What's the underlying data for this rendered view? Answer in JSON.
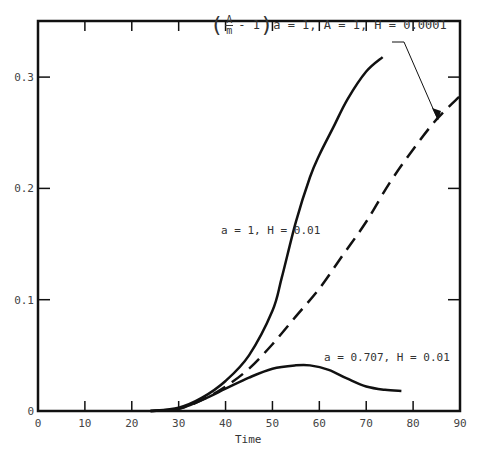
{
  "chart_data": {
    "type": "line",
    "title": "",
    "xlabel": "Time",
    "ylabel": "",
    "xlim": [
      0,
      90
    ],
    "ylim": [
      0,
      0.35
    ],
    "x_ticks": [
      "0",
      "10",
      "20",
      "30",
      "40",
      "50",
      "60",
      "70",
      "80",
      "90"
    ],
    "y_ticks": [
      "0",
      "0.1",
      "0.2",
      "0.3"
    ],
    "grid": false,
    "series": [
      {
        "name": "a = 1, H = 0.01",
        "style": "solid",
        "x": [
          24,
          30,
          35,
          40,
          45,
          50,
          52,
          55,
          58,
          60,
          63,
          66,
          70,
          73.5
        ],
        "y": [
          0,
          0.003,
          0.012,
          0.027,
          0.05,
          0.09,
          0.12,
          0.17,
          0.21,
          0.23,
          0.255,
          0.28,
          0.305,
          0.318
        ]
      },
      {
        "name": "(A/m - 1) a = 1, A = 1, H = 0.0001",
        "style": "dashed",
        "x": [
          24,
          30,
          35,
          40,
          45,
          50,
          55,
          60,
          65,
          70,
          75,
          80,
          85,
          90
        ],
        "y": [
          0,
          0.002,
          0.01,
          0.022,
          0.038,
          0.06,
          0.085,
          0.11,
          0.14,
          0.17,
          0.205,
          0.235,
          0.262,
          0.283
        ]
      },
      {
        "name": "a = 0.707, H = 0.01",
        "style": "solid",
        "x": [
          24,
          30,
          35,
          40,
          45,
          50,
          55,
          58,
          62,
          66,
          70,
          74,
          77.5
        ],
        "y": [
          0,
          0.002,
          0.01,
          0.02,
          0.03,
          0.038,
          0.041,
          0.041,
          0.037,
          0.029,
          0.022,
          0.019,
          0.018
        ]
      }
    ],
    "annotations": [
      {
        "text": "a = 1, H = 0.01"
      },
      {
        "text": "(A/m - 1) a = 1, A = 1, H = 0.0001"
      },
      {
        "text": "a = 0.707, H = 0.01"
      }
    ]
  },
  "labels": {
    "xlabel": "Time",
    "ann_top_frac_num": "A",
    "ann_top_frac_den": "m",
    "ann_top_rest": "- 1",
    "ann_top_params": "a = 1, A = 1, H = 0.0001",
    "ann_mid": "a = 1, H = 0.01",
    "ann_low": "a = 0.707, H = 0.01"
  }
}
